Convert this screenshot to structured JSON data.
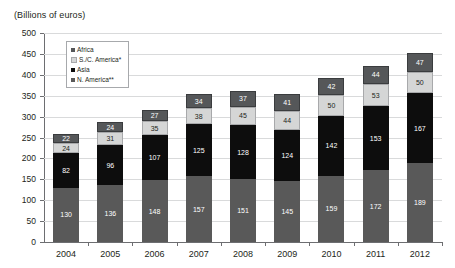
{
  "chart_data": {
    "type": "bar",
    "stacked": true,
    "title": "(Billions of euros)",
    "xlabel": "",
    "ylabel": "",
    "ylim": [
      0,
      500
    ],
    "ytick_step": 50,
    "yticks": [
      500,
      450,
      400,
      350,
      300,
      250,
      200,
      150,
      100,
      50,
      0
    ],
    "grid": true,
    "legend_position": "top-left-inside",
    "categories": [
      "2004",
      "2005",
      "2006",
      "2007",
      "2008",
      "2009",
      "2010",
      "2011",
      "2012"
    ],
    "series": [
      {
        "name": "N. America**",
        "color": "#595959",
        "values": [
          130,
          136,
          148,
          157,
          151,
          145,
          159,
          172,
          189
        ]
      },
      {
        "name": "Asia",
        "color": "#0d0d0d",
        "values": [
          82,
          96,
          107,
          125,
          128,
          124,
          142,
          153,
          167
        ]
      },
      {
        "name": "S./C. America*",
        "color": "#d5d6d6",
        "values": [
          24,
          31,
          35,
          38,
          45,
          44,
          50,
          53,
          50
        ]
      },
      {
        "name": "Africa",
        "color": "#555759",
        "values": [
          22,
          24,
          27,
          34,
          37,
          41,
          42,
          44,
          47
        ]
      }
    ],
    "totals": [
      258,
      287,
      317,
      354,
      361,
      354,
      393,
      422,
      453
    ]
  }
}
